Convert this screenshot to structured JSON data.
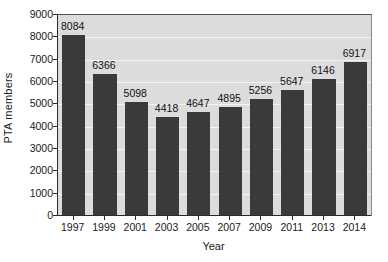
{
  "chart_data": {
    "type": "bar",
    "title": "",
    "subtitle": "",
    "xlabel": "Year",
    "ylabel": "PTA members",
    "categories": [
      "1997",
      "1999",
      "2001",
      "2003",
      "2005",
      "2007",
      "2009",
      "2011",
      "2013",
      "2014"
    ],
    "values": [
      8084,
      6366,
      5098,
      4418,
      4647,
      4895,
      5256,
      5647,
      6146,
      6917
    ],
    "data_labels": [
      "8084",
      "6366",
      "5098",
      "4418",
      "4647",
      "4895",
      "5256",
      "5647",
      "6146",
      "6917"
    ],
    "ylim": [
      0,
      9000
    ],
    "ytick_values": [
      0,
      1000,
      2000,
      3000,
      4000,
      5000,
      6000,
      7000,
      8000,
      9000
    ],
    "ytick_labels": [
      "0",
      "1000",
      "2000",
      "3000",
      "4000",
      "5000",
      "6000",
      "7000",
      "8000",
      "9000"
    ],
    "grid": true,
    "grid_orientation": "horizontal",
    "legend": false,
    "legend_position": "none",
    "colors": {
      "bar_fill": "#3a3a3a",
      "plot_background": "#dcdcdc",
      "gridline": "#f4f4f4",
      "axis_line": "#2a2a2a",
      "text": "#1a1a1a",
      "figure_background": "#ffffff"
    }
  }
}
